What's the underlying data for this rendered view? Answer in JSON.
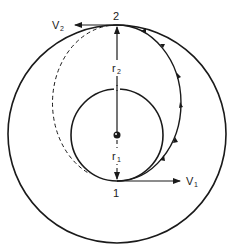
{
  "diagram": {
    "labels": {
      "point_1": "1",
      "point_2": "2",
      "v1": "V",
      "v1_sub": "1",
      "v2": "V",
      "v2_sub": "2",
      "r1": "r",
      "r1_sub": "1",
      "r2": "r",
      "r2_sub": "2"
    },
    "colors": {
      "stroke": "#1a1a1a",
      "background": "#ffffff"
    },
    "geometry": {
      "center": [
        117,
        135
      ],
      "inner_radius": 46,
      "outer_radius": 109,
      "transfer_ellipse": {
        "cx": 117,
        "cy": 103,
        "rx": 64,
        "ry": 78
      }
    }
  }
}
